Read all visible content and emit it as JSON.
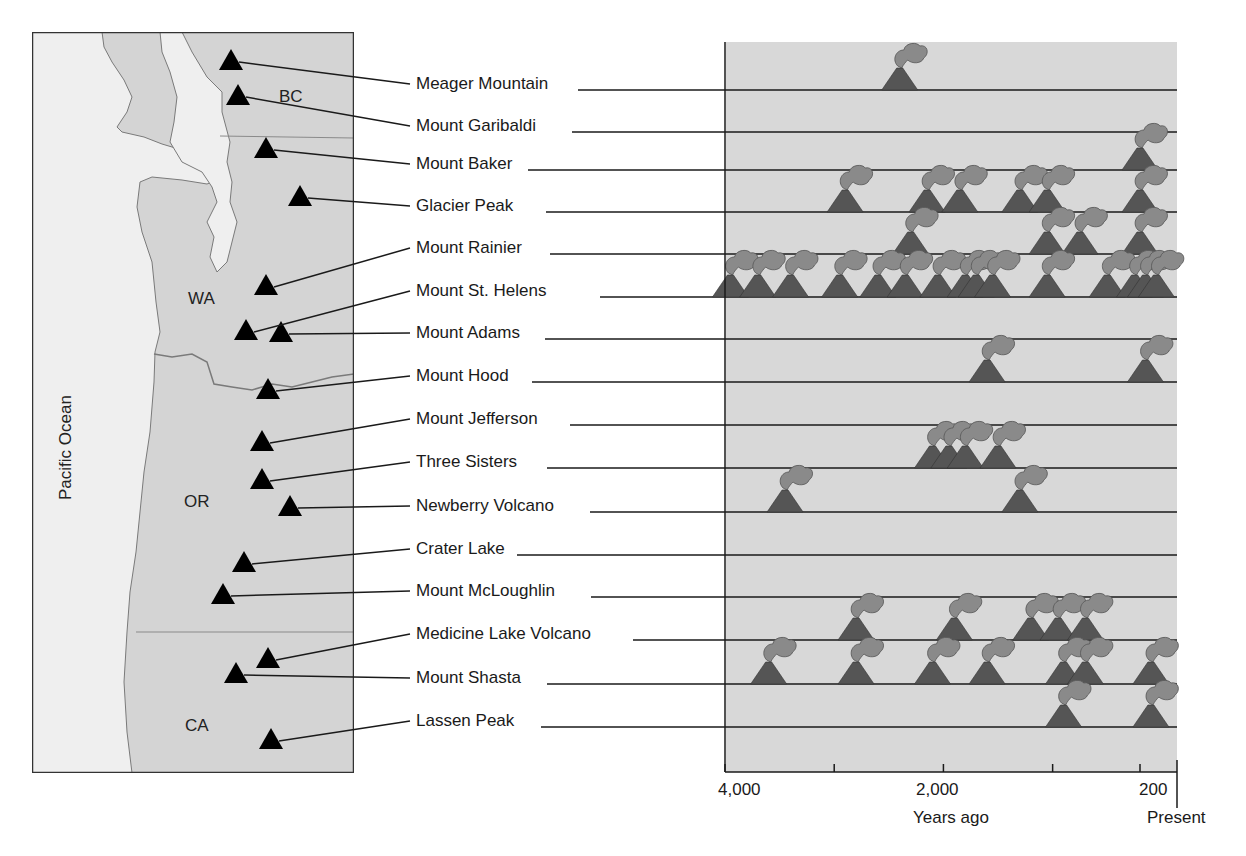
{
  "map": {
    "ocean_label": "Pacific Ocean",
    "regions": [
      {
        "id": "bc",
        "label": "BC"
      },
      {
        "id": "wa",
        "label": "WA"
      },
      {
        "id": "or",
        "label": "OR"
      },
      {
        "id": "ca",
        "label": "CA"
      }
    ],
    "colors": {
      "land": "#d4d4d4",
      "ocean": "#efefef",
      "border": "#7a7a7a",
      "volcano_marker": "#000000"
    }
  },
  "chart_data": {
    "type": "scatter",
    "title": "",
    "xlabel": "Years ago",
    "ylabel": "",
    "x_reversed": true,
    "xlim": [
      4000,
      0
    ],
    "x_ticks": [
      {
        "value": 4000,
        "label": "4,000"
      },
      {
        "value": 3000,
        "label": ""
      },
      {
        "value": 2000,
        "label": "2,000"
      },
      {
        "value": 1000,
        "label": ""
      },
      {
        "value": 200,
        "label": "200"
      }
    ],
    "present_label": "Present",
    "marker": "erupting-volcano",
    "colors": {
      "background": "#d8d8d8",
      "cone": "#555555",
      "plume": "#8a8a8a",
      "line": "#1a1a1a"
    },
    "series": [
      {
        "name": "Meager Mountain",
        "eruptions_years_ago": [
          2400
        ]
      },
      {
        "name": "Mount Garibaldi",
        "eruptions_years_ago": []
      },
      {
        "name": "Mount Baker",
        "eruptions_years_ago": [
          200
        ]
      },
      {
        "name": "Glacier Peak",
        "eruptions_years_ago": [
          2900,
          2150,
          1850,
          1300,
          1050,
          200
        ]
      },
      {
        "name": "Mount Rainier",
        "eruptions_years_ago": [
          2300,
          1050,
          750,
          200
        ]
      },
      {
        "name": "Mount St. Helens",
        "eruptions_years_ago": [
          3950,
          3700,
          3400,
          2950,
          2600,
          2350,
          2050,
          1800,
          1700,
          1550,
          1050,
          500,
          250,
          150,
          50
        ]
      },
      {
        "name": "Mount Adams",
        "eruptions_years_ago": []
      },
      {
        "name": "Mount Hood",
        "eruptions_years_ago": [
          1600,
          150
        ]
      },
      {
        "name": "Mount Jefferson",
        "eruptions_years_ago": []
      },
      {
        "name": "Three Sisters",
        "eruptions_years_ago": [
          2100,
          1950,
          1800,
          1500
        ]
      },
      {
        "name": "Newberry Volcano",
        "eruptions_years_ago": [
          3450,
          1300
        ]
      },
      {
        "name": "Crater Lake",
        "eruptions_years_ago": []
      },
      {
        "name": "Mount McLoughlin",
        "eruptions_years_ago": []
      },
      {
        "name": "Medicine Lake Volcano",
        "eruptions_years_ago": [
          2800,
          1900,
          1200,
          950,
          700
        ]
      },
      {
        "name": "Mount Shasta",
        "eruptions_years_ago": [
          3600,
          2800,
          2100,
          1600,
          900,
          700,
          100
        ]
      },
      {
        "name": "Lassen Peak",
        "eruptions_years_ago": [
          900,
          100
        ]
      }
    ]
  }
}
